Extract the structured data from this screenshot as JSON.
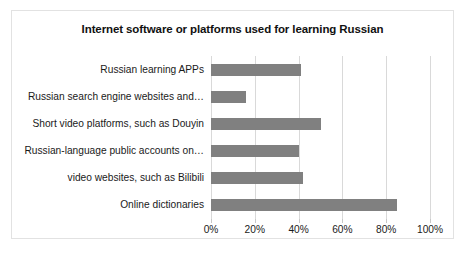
{
  "chart_data": {
    "type": "bar",
    "orientation": "horizontal",
    "title": "Internet software or platforms used for learning Russian",
    "xlabel": "",
    "ylabel": "",
    "xlim": [
      0,
      100
    ],
    "xunit": "%",
    "grid": true,
    "legend": false,
    "bar_color": "#808080",
    "gridline_color": "#d9d9d9",
    "border_color": "#e2e2e2",
    "categories": [
      "Russian learning APPs",
      "Russian search engine websites and…",
      "Short video platforms, such as Douyin",
      "Russian-language public accounts on…",
      "video websites, such as Bilibili",
      "Online dictionaries"
    ],
    "values": [
      41,
      16,
      50,
      40,
      42,
      85
    ],
    "xticks": [
      0,
      20,
      40,
      60,
      80,
      100
    ],
    "xticklabels": [
      "0%",
      "20%",
      "40%",
      "60%",
      "80%",
      "100%"
    ]
  }
}
